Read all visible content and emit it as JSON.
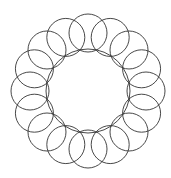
{
  "diagram": {
    "type": "circle-rosette",
    "center": [
      88,
      91
    ],
    "ring_circle_count": 16,
    "ring_circle_center_radius": 58,
    "ring_circle_radius": 19,
    "inner_circle_radius": 42,
    "stroke_color": "#333333",
    "background": "#ffffff"
  }
}
